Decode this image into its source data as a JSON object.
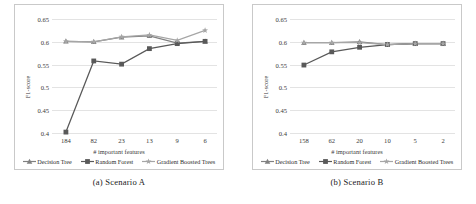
{
  "figure": {
    "panels": [
      {
        "id": "scenario-a",
        "caption": "(a) Scenario A",
        "chart_data": {
          "type": "line",
          "title": "",
          "xlabel": "# important features",
          "ylabel": "F1-score",
          "categories": [
            "184",
            "82",
            "23",
            "13",
            "9",
            "6"
          ],
          "yticks": [
            "0.4",
            "0.45",
            "0.5",
            "0.55",
            "0.6",
            "0.65"
          ],
          "ylim": [
            0.4,
            0.65
          ],
          "grid": true,
          "legend_position": "bottom",
          "series": [
            {
              "name": "Decision Tree",
              "color": "#808080",
              "marker": "triangle",
              "values": [
                0.601,
                0.6,
                0.61,
                0.613,
                0.597,
                0.601
              ]
            },
            {
              "name": "Random Forest",
              "color": "#595959",
              "marker": "square",
              "values": [
                0.402,
                0.558,
                0.551,
                0.585,
                0.596,
                0.601
              ]
            },
            {
              "name": "Gradient Boosted Trees",
              "color": "#a6a6a6",
              "marker": "star",
              "values": [
                0.601,
                0.6,
                0.611,
                0.615,
                0.603,
                0.625
              ]
            }
          ]
        }
      },
      {
        "id": "scenario-b",
        "caption": "(b) Scenario B",
        "chart_data": {
          "type": "line",
          "title": "",
          "xlabel": "# important features",
          "ylabel": "F1-score",
          "categories": [
            "158",
            "62",
            "20",
            "10",
            "5",
            "2"
          ],
          "yticks": [
            "0.4",
            "0.45",
            "0.5",
            "0.55",
            "0.6",
            "0.65"
          ],
          "ylim": [
            0.4,
            0.65
          ],
          "grid": true,
          "legend_position": "bottom",
          "series": [
            {
              "name": "Decision Tree",
              "color": "#808080",
              "marker": "triangle",
              "values": [
                0.598,
                0.598,
                0.6,
                0.594,
                0.596,
                0.596
              ]
            },
            {
              "name": "Random Forest",
              "color": "#595959",
              "marker": "square",
              "values": [
                0.549,
                0.578,
                0.588,
                0.594,
                0.596,
                0.596
              ]
            },
            {
              "name": "Gradient Boosted Trees",
              "color": "#a6a6a6",
              "marker": "star",
              "values": [
                0.598,
                0.598,
                0.598,
                0.594,
                0.596,
                0.596
              ]
            }
          ]
        }
      }
    ]
  }
}
